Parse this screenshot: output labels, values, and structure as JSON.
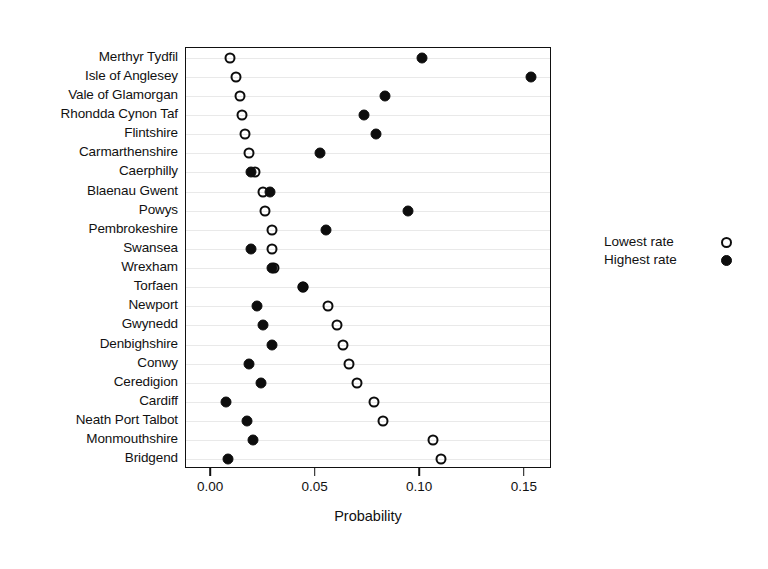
{
  "chart_data": {
    "type": "scatter",
    "title": "",
    "subtitle": "",
    "xlabel": "Probability",
    "ylabel": "",
    "xlim": [
      -0.012,
      0.163
    ],
    "ylim": [
      0,
      21
    ],
    "grid": true,
    "grid_axis": "y",
    "legend_position": "right",
    "xticks": [
      0.0,
      0.05,
      0.1,
      0.15
    ],
    "xticklabels": [
      "0.00",
      "0.05",
      "0.10",
      "0.15"
    ],
    "categories": [
      "Merthyr Tydfil",
      "Isle of Anglesey",
      "Vale of Glamorgan",
      "Rhondda Cynon Taf",
      "Flintshire",
      "Carmarthenshire",
      "Caerphilly",
      "Blaenau Gwent",
      "Powys",
      "Pembrokeshire",
      "Swansea",
      "Wrexham",
      "Torfaen",
      "Newport",
      "Gwynedd",
      "Denbighshire",
      "Conwy",
      "Ceredigion",
      "Cardiff",
      "Neath Port Talbot",
      "Monmouthshire",
      "Bridgend"
    ],
    "series": [
      {
        "name": "Lowest rate",
        "marker": "open-circle",
        "color": "#0d0d0d",
        "values": [
          0.009,
          0.012,
          0.014,
          0.015,
          0.016,
          0.018,
          0.021,
          0.025,
          0.026,
          0.029,
          0.029,
          0.03,
          0.044,
          0.056,
          0.06,
          0.063,
          0.066,
          0.07,
          0.078,
          0.082,
          0.106,
          0.11
        ]
      },
      {
        "name": "Highest rate",
        "marker": "filled-circle",
        "color": "#0d0d0d",
        "values": [
          0.101,
          0.153,
          0.083,
          0.073,
          0.079,
          0.052,
          0.019,
          0.028,
          0.094,
          0.055,
          0.019,
          0.029,
          0.044,
          0.022,
          0.025,
          0.029,
          0.018,
          0.024,
          0.007,
          0.017,
          0.02,
          0.008
        ]
      }
    ]
  },
  "legend": {
    "entries": [
      {
        "label": "Lowest rate",
        "marker": "open-circle"
      },
      {
        "label": "Highest rate",
        "marker": "filled-circle"
      }
    ]
  },
  "axis": {
    "x_title": "Probability"
  }
}
